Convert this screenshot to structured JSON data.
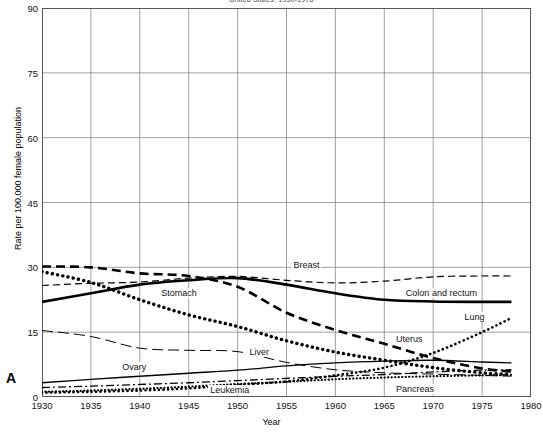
{
  "title": "United States, 1930-1978",
  "panel_letter": "A",
  "axes": {
    "ylabel": "Rate per 100,000 female population",
    "xlabel": "Year",
    "yticks": [
      0,
      15,
      30,
      45,
      60,
      75,
      90
    ],
    "xticks": [
      1930,
      1935,
      1940,
      1945,
      1950,
      1955,
      1960,
      1965,
      1970,
      1975,
      1980
    ]
  },
  "chart_data": {
    "type": "line",
    "title": "United States, 1930-1978",
    "xlabel": "Year",
    "ylabel": "Rate per 100,000 female population",
    "xlim": [
      1930,
      1980
    ],
    "ylim": [
      0,
      90
    ],
    "grid": true,
    "legend": "inline-labels",
    "x": [
      1930,
      1935,
      1940,
      1945,
      1950,
      1955,
      1960,
      1965,
      1970,
      1975,
      1978
    ],
    "series": [
      {
        "name": "Uterus",
        "style": "thick-dashed",
        "label_x": 1966,
        "label_y": 13.5,
        "values": [
          30.2,
          30.0,
          28.6,
          28.0,
          25.5,
          19.5,
          15.5,
          12.3,
          9.0,
          6.6,
          5.9
        ]
      },
      {
        "name": "Breast",
        "style": "thin-dashed",
        "label_x": 1955.5,
        "label_y": 30.5,
        "values": [
          25.8,
          26.3,
          26.6,
          27.5,
          27.9,
          27.0,
          26.4,
          26.8,
          27.8,
          28.0,
          28.0
        ]
      },
      {
        "name": "Colon and rectum",
        "style": "thick-solid",
        "label_x": 1967,
        "label_y": 24.0,
        "values": [
          22.0,
          24.0,
          26.0,
          27.0,
          27.5,
          26.0,
          24.0,
          22.5,
          22.1,
          22.0,
          22.0
        ]
      },
      {
        "name": "Stomach",
        "style": "dotted-thick",
        "label_x": 1942,
        "label_y": 24.0,
        "values": [
          29.0,
          26.5,
          22.5,
          19.0,
          16.3,
          13.0,
          10.4,
          8.5,
          6.8,
          5.6,
          5.2
        ]
      },
      {
        "name": "Lung",
        "style": "dotted-small",
        "label_x": 1973,
        "label_y": 18.5,
        "values": [
          1.0,
          1.2,
          1.5,
          2.0,
          2.8,
          3.6,
          5.0,
          6.8,
          10.2,
          15.0,
          18.3
        ]
      },
      {
        "name": "Liver",
        "style": "thin-longdash",
        "label_x": 1951,
        "label_y": 10.5,
        "values": [
          15.4,
          14.0,
          11.3,
          10.8,
          10.5,
          8.0,
          6.3,
          5.6,
          5.3,
          5.0,
          4.8
        ]
      },
      {
        "name": "Ovary",
        "style": "thin-solid",
        "label_x": 1938,
        "label_y": 7.0,
        "values": [
          3.3,
          4.1,
          4.8,
          5.5,
          6.2,
          7.2,
          7.9,
          8.3,
          8.5,
          8.1,
          7.9
        ]
      },
      {
        "name": "Pancreas",
        "style": "thin-dashdot",
        "label_x": 1966,
        "label_y": 1.8,
        "values": [
          2.2,
          2.5,
          2.9,
          3.3,
          3.8,
          4.3,
          4.8,
          5.2,
          5.8,
          6.2,
          6.3
        ]
      },
      {
        "name": "Leukemia",
        "style": "dotted-fine",
        "label_x": 1947,
        "label_y": 1.7,
        "values": [
          1.2,
          1.5,
          1.9,
          2.4,
          3.0,
          3.5,
          4.1,
          4.5,
          4.8,
          5.0,
          5.1
        ]
      }
    ]
  }
}
